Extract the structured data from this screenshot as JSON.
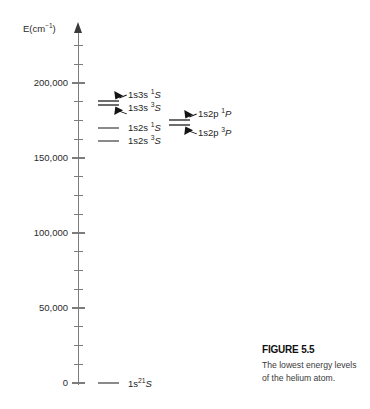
{
  "figure": {
    "caption_title": "FIGURE 5.5",
    "caption_text": "The lowest energy levels of the helium atom."
  },
  "axis": {
    "label_main": "E(cm",
    "label_sup": "−1",
    "label_close": ")",
    "arrow_icon": "axis-arrow-up-icon",
    "unit": "cm^-1",
    "ymin": 0,
    "ymax": 225000,
    "major_interval": 50000,
    "minor_interval": 12500,
    "ticks": [
      {
        "value": 200000,
        "label": "200,000",
        "major": true
      },
      {
        "value": 187500,
        "label": "",
        "major": false
      },
      {
        "value": 175000,
        "label": "",
        "major": false
      },
      {
        "value": 162500,
        "label": "",
        "major": false
      },
      {
        "value": 150000,
        "label": "150,000",
        "major": true
      },
      {
        "value": 137500,
        "label": "",
        "major": false
      },
      {
        "value": 125000,
        "label": "",
        "major": false
      },
      {
        "value": 112500,
        "label": "",
        "major": false
      },
      {
        "value": 100000,
        "label": "100,000",
        "major": true
      },
      {
        "value": 87500,
        "label": "",
        "major": false
      },
      {
        "value": 75000,
        "label": "",
        "major": false
      },
      {
        "value": 62500,
        "label": "",
        "major": false
      },
      {
        "value": 50000,
        "label": "50,000",
        "major": true
      },
      {
        "value": 37500,
        "label": "",
        "major": false
      },
      {
        "value": 25000,
        "label": "",
        "major": false
      },
      {
        "value": 12500,
        "label": "",
        "major": false
      },
      {
        "value": 0,
        "label": "0",
        "major": true
      },
      {
        "value": 212500,
        "label": "",
        "major": false
      },
      {
        "value": 225000,
        "label": "",
        "major": false
      }
    ]
  },
  "chart_data": {
    "type": "line",
    "title": "The lowest energy levels of the helium atom",
    "xlabel": "",
    "ylabel": "E(cm^-1)",
    "ylim": [
      0,
      225000
    ],
    "grid": false,
    "legend": "none",
    "levels": [
      {
        "id": "1s3s-1S",
        "config": "1s3s",
        "multiplicity": "1",
        "term": "S",
        "energy": 184864,
        "column": "left",
        "label": "1s3s ¹S"
      },
      {
        "id": "1s3s-3S",
        "config": "1s3s",
        "multiplicity": "3",
        "term": "S",
        "energy": 183237,
        "column": "left",
        "label": "1s3s ³S"
      },
      {
        "id": "1s2p-1P",
        "config": "1s2p",
        "multiplicity": "1",
        "term": "P",
        "energy": 171135,
        "column": "right",
        "label": "1s2p ¹P"
      },
      {
        "id": "1s2p-3P",
        "config": "1s2p",
        "multiplicity": "3",
        "term": "P",
        "energy": 169087,
        "column": "right",
        "label": "1s2p ³P"
      },
      {
        "id": "1s2s-1S",
        "config": "1s2s",
        "multiplicity": "1",
        "term": "S",
        "energy": 166272,
        "column": "left",
        "label": "1s2s ¹S"
      },
      {
        "id": "1s2s-3S",
        "config": "1s2s",
        "multiplicity": "3",
        "term": "S",
        "energy": 159856,
        "column": "left",
        "label": "1s2s ³S"
      },
      {
        "id": "1s2-1S",
        "config": "1s²",
        "multiplicity": "1",
        "term": "S",
        "energy": 0,
        "column": "ground",
        "label": "1s² ¹S"
      }
    ]
  },
  "labels": {
    "l_1s3s_1S": {
      "config": "1s3s ",
      "sup": "1",
      "term": "S"
    },
    "l_1s3s_3S": {
      "config": "1s3s ",
      "sup": "3",
      "term": "S"
    },
    "l_1s2s_1S": {
      "config": "1s2s ",
      "sup": "1",
      "term": "S"
    },
    "l_1s2s_3S": {
      "config": "1s2s ",
      "sup": "3",
      "term": "S"
    },
    "l_1s2p_1P": {
      "config": "1s2p ",
      "sup": "1",
      "term": "P"
    },
    "l_1s2p_3P": {
      "config": "1s2p ",
      "sup": "3",
      "term": "P"
    },
    "l_1s2_1S": {
      "config": "1s",
      "sq": "2",
      "sup": "1",
      "term": "S"
    }
  }
}
